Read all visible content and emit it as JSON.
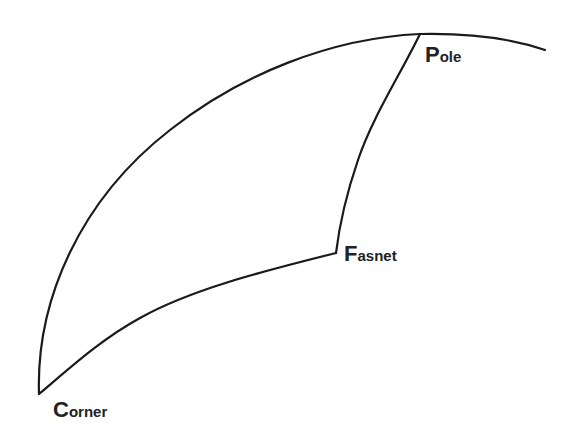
{
  "diagram": {
    "type": "spherical-triangle",
    "stroke_color": "#1a1a1a",
    "text_color": "#222222",
    "background": "#ffffff",
    "nodes": [
      {
        "id": "pole",
        "initial": "P",
        "rest": "ole",
        "label": "Pole",
        "x": 420,
        "y": 34
      },
      {
        "id": "fasnet",
        "initial": "F",
        "rest": "asnet",
        "label": "Fasnet",
        "x": 334,
        "y": 253
      },
      {
        "id": "corner",
        "initial": "C",
        "rest": "orner",
        "label": "Corner",
        "x": 39,
        "y": 394
      }
    ],
    "edges": [
      {
        "id": "outer-arc",
        "from": "corner",
        "to": "pole",
        "note": "great-circle arc continuing past Pole"
      },
      {
        "id": "pole-fasnet",
        "from": "pole",
        "to": "fasnet"
      },
      {
        "id": "fasnet-corner",
        "from": "fasnet",
        "to": "corner"
      }
    ]
  }
}
